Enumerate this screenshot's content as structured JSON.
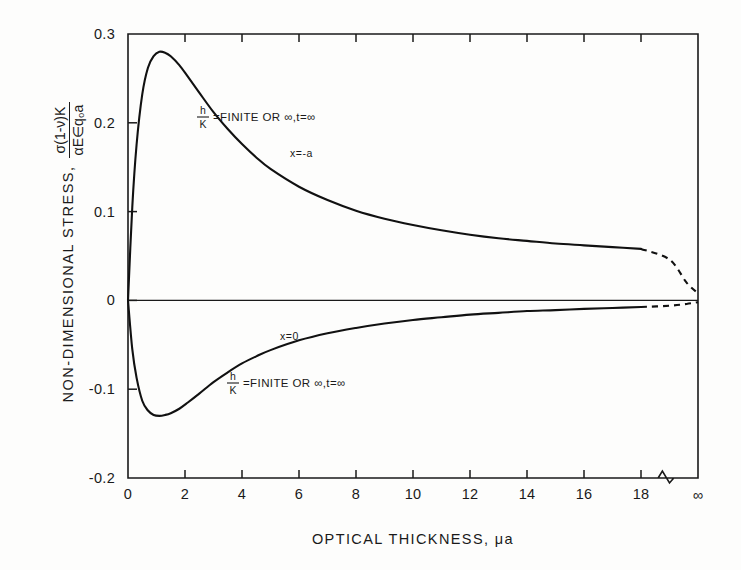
{
  "chart_data": {
    "type": "line",
    "title": "",
    "xlabel": "OPTICAL THICKNESS, μa",
    "ylabel_text": "NON-DIMENSIONAL STRESS,",
    "ylabel_fraction_numerator": "σ(1-ν)K",
    "ylabel_fraction_denominator": "αE∈q₀a",
    "grid": false,
    "legend_position": "inline-annotations",
    "xlim": [
      0,
      20
    ],
    "ylim": [
      -0.2,
      0.3
    ],
    "x_ticks": [
      "0",
      "2",
      "4",
      "6",
      "8",
      "10",
      "12",
      "14",
      "16",
      "18",
      "∞"
    ],
    "x_tick_values": [
      0,
      2,
      4,
      6,
      8,
      10,
      12,
      14,
      16,
      18,
      20
    ],
    "y_ticks": [
      "0.3",
      "0.2",
      "0.1",
      "0",
      "-0.1",
      "-0.2"
    ],
    "y_tick_values": [
      0.3,
      0.2,
      0.1,
      0,
      -0.1,
      -0.2
    ],
    "axis_break": {
      "present": true,
      "between": [
        18,
        20
      ],
      "style": "zigzag"
    },
    "series": [
      {
        "name": "x = -a",
        "label": "x=-a",
        "style": "solid-then-dashed",
        "dash_starts_at_x": 18.0,
        "x": [
          0,
          0.15,
          0.3,
          0.5,
          0.7,
          0.9,
          1.1,
          1.3,
          1.5,
          1.8,
          2.1,
          2.5,
          3.0,
          3.5,
          4.0,
          4.5,
          5.0,
          6.0,
          7.0,
          8.0,
          9.0,
          10.0,
          11.0,
          12.0,
          13.0,
          14.0,
          15.0,
          16.0,
          17.0,
          18.0,
          19.0,
          19.6,
          20.0
        ],
        "y": [
          0.0,
          0.105,
          0.175,
          0.232,
          0.262,
          0.275,
          0.28,
          0.279,
          0.275,
          0.265,
          0.252,
          0.234,
          0.212,
          0.193,
          0.176,
          0.161,
          0.148,
          0.128,
          0.113,
          0.101,
          0.092,
          0.085,
          0.079,
          0.074,
          0.07,
          0.067,
          0.064,
          0.062,
          0.06,
          0.058,
          0.046,
          0.02,
          0.008
        ]
      },
      {
        "name": "x = 0",
        "label": "x=0",
        "style": "solid-then-dashed",
        "dash_starts_at_x": 18.0,
        "x": [
          0,
          0.15,
          0.3,
          0.5,
          0.7,
          0.9,
          1.1,
          1.3,
          1.5,
          1.8,
          2.1,
          2.5,
          3.0,
          3.5,
          4.0,
          4.5,
          5.0,
          6.0,
          7.0,
          8.0,
          9.0,
          10.0,
          11.0,
          12.0,
          13.0,
          14.0,
          15.0,
          16.0,
          17.0,
          18.0,
          19.0,
          19.6,
          20.0
        ],
        "y": [
          0.0,
          -0.055,
          -0.087,
          -0.113,
          -0.124,
          -0.129,
          -0.13,
          -0.129,
          -0.127,
          -0.122,
          -0.115,
          -0.105,
          -0.092,
          -0.081,
          -0.071,
          -0.063,
          -0.056,
          -0.045,
          -0.037,
          -0.031,
          -0.026,
          -0.022,
          -0.019,
          -0.016,
          -0.014,
          -0.012,
          -0.011,
          -0.0095,
          -0.0085,
          -0.0075,
          -0.006,
          -0.004,
          -0.002
        ]
      }
    ],
    "annotations": [
      {
        "id": "upper-condition",
        "kind": "fraction-equation",
        "numerator": "h",
        "denominator": "K",
        "rest": "=FINITE OR ∞,t=∞",
        "x_px": 198,
        "y_px": 117
      },
      {
        "id": "upper-curve-label",
        "kind": "text",
        "text": "x=-a",
        "x_px": 290,
        "y_px": 157
      },
      {
        "id": "lower-curve-label",
        "kind": "text",
        "text": "x=0",
        "x_px": 280,
        "y_px": 340
      },
      {
        "id": "lower-condition",
        "kind": "fraction-equation",
        "numerator": "h",
        "denominator": "K",
        "rest": "=FINITE OR ∞,t=∞",
        "x_px": 228,
        "y_px": 383
      }
    ]
  },
  "figure": {
    "background_color": "#fdfdfc",
    "ink_color": "#111111"
  }
}
